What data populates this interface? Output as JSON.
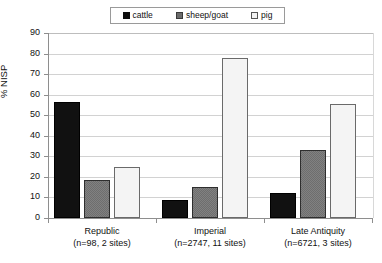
{
  "chart_data": {
    "type": "bar",
    "title": "",
    "xlabel": "",
    "ylabel": "% NISP",
    "ylim": [
      0,
      90
    ],
    "ytick_step": 10,
    "yticks": [
      "90",
      "80",
      "70",
      "60",
      "50",
      "40",
      "30",
      "20",
      "10",
      "0"
    ],
    "grid": true,
    "legend_position": "top-center",
    "categories": [
      "Republic",
      "Imperial",
      "Late Antiquity"
    ],
    "category_sublabels": [
      "(n=98, 2 sites)",
      "(n=2747, 11 sites)",
      "(n=6721, 3 sites)"
    ],
    "series": [
      {
        "name": "cattle",
        "color": "#111111",
        "values": [
          56.5,
          8.7,
          12.2
        ]
      },
      {
        "name": "sheep/goat",
        "color": "#6e6e6e",
        "values": [
          18.6,
          15.0,
          33.3
        ]
      },
      {
        "name": "pig",
        "color": "#f4f4f4",
        "values": [
          25.0,
          77.8,
          55.6
        ]
      }
    ]
  },
  "legend": {
    "entries": [
      {
        "label": "cattle",
        "swatch": "black-square-icon"
      },
      {
        "label": "sheep/goat",
        "swatch": "gray-square-icon"
      },
      {
        "label": "pig",
        "swatch": "white-square-icon"
      }
    ]
  },
  "axes": {
    "y_title": "% NISP"
  }
}
